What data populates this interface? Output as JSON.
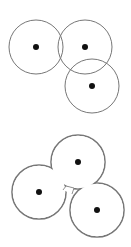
{
  "diagram": {
    "top": {
      "description": "three overlapping circles, each with a center dot",
      "circles": [
        {
          "cx": 36,
          "cy": 47,
          "r": 27
        },
        {
          "cx": 85,
          "cy": 47,
          "r": 27
        },
        {
          "cx": 92,
          "cy": 86,
          "r": 27
        }
      ]
    },
    "bottom": {
      "description": "union outline of three circles with center dots",
      "circles": [
        {
          "cx": 39,
          "cy": 192,
          "r": 27
        },
        {
          "cx": 78,
          "cy": 162,
          "r": 27
        },
        {
          "cx": 97,
          "cy": 210,
          "r": 27
        }
      ]
    },
    "colors": {
      "stroke": "#777777",
      "dot": "#111111",
      "background": "#ffffff"
    }
  }
}
